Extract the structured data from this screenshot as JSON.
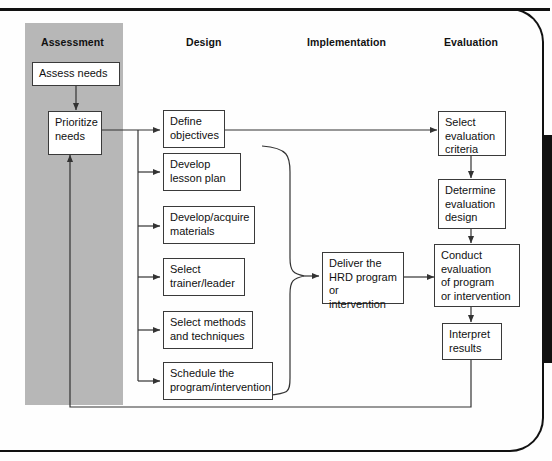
{
  "diagram": {
    "type": "flowchart",
    "accent_band_color": "#b7b7b7",
    "line_color": "#333333",
    "box_border_color": "#3a3a3a"
  },
  "columns": [
    {
      "key": "assessment",
      "label": "Assessment"
    },
    {
      "key": "design",
      "label": "Design"
    },
    {
      "key": "implementation",
      "label": "Implementation"
    },
    {
      "key": "evaluation",
      "label": "Evaluation"
    }
  ],
  "nodes": {
    "assess_needs": {
      "label": "Assess needs",
      "column": "assessment"
    },
    "prioritize": {
      "label": "Prioritize\nneeds",
      "column": "assessment"
    },
    "define_obj": {
      "label": "Define\nobjectives",
      "column": "design"
    },
    "lesson_plan": {
      "label": "Develop\nlesson plan",
      "column": "design"
    },
    "materials": {
      "label": "Develop/acquire\nmaterials",
      "column": "design"
    },
    "trainer": {
      "label": "Select\ntrainer/leader",
      "column": "design"
    },
    "methods": {
      "label": "Select methods\nand techniques",
      "column": "design"
    },
    "schedule": {
      "label": "Schedule the\nprogram/intervention",
      "column": "design"
    },
    "deliver": {
      "label": "Deliver the\nHRD program\nor intervention",
      "column": "implementation"
    },
    "select_criteria": {
      "label": "Select\nevaluation\ncriteria",
      "column": "evaluation"
    },
    "determine_design": {
      "label": "Determine\nevaluation\ndesign",
      "column": "evaluation"
    },
    "conduct_eval": {
      "label": "Conduct\nevaluation\nof program\nor intervention",
      "column": "evaluation"
    },
    "interpret": {
      "label": "Interpret\nresults",
      "column": "evaluation"
    }
  },
  "edges": [
    {
      "from": "assess_needs",
      "to": "prioritize",
      "style": "arrow-down"
    },
    {
      "from": "prioritize",
      "to": "define_obj",
      "style": "arrow-right"
    },
    {
      "from": "prioritize",
      "to": "lesson_plan",
      "style": "branch-right"
    },
    {
      "from": "prioritize",
      "to": "materials",
      "style": "branch-right"
    },
    {
      "from": "prioritize",
      "to": "trainer",
      "style": "branch-right"
    },
    {
      "from": "prioritize",
      "to": "methods",
      "style": "branch-right"
    },
    {
      "from": "prioritize",
      "to": "schedule",
      "style": "branch-right"
    },
    {
      "from": "define_obj",
      "to": "select_criteria",
      "style": "arrow-right-long"
    },
    {
      "from": "design_group",
      "to": "deliver",
      "style": "brace"
    },
    {
      "from": "deliver",
      "to": "conduct_eval",
      "style": "arrow-right"
    },
    {
      "from": "select_criteria",
      "to": "determine_design",
      "style": "arrow-down"
    },
    {
      "from": "determine_design",
      "to": "conduct_eval",
      "style": "arrow-down"
    },
    {
      "from": "conduct_eval",
      "to": "interpret",
      "style": "arrow-down"
    },
    {
      "from": "interpret",
      "to": "prioritize",
      "style": "feedback-loop"
    }
  ]
}
